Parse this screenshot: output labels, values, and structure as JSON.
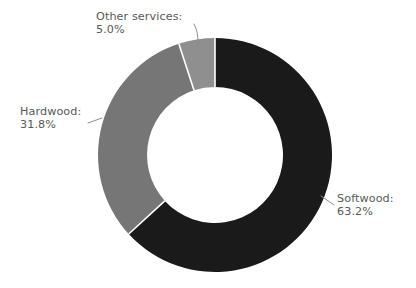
{
  "chart_data": {
    "type": "pie",
    "variant": "donut",
    "title": "",
    "subtitle": "",
    "xlabel": "",
    "ylabel": "",
    "legend_position": "none",
    "grid": false,
    "units": "percent",
    "start_angle_deg": 0,
    "direction": "clockwise",
    "hole_ratio": 0.58,
    "categories": [
      "Softwood",
      "Hardwood",
      "Other services"
    ],
    "values": [
      63.2,
      31.8,
      5.0
    ],
    "value_labels": [
      "63.2%",
      "31.8%",
      "5.0%"
    ],
    "colors": [
      "#1a1a1a",
      "#767676",
      "#8f8f8f"
    ],
    "slices": [
      {
        "name": "Softwood",
        "label_name": "Softwood:",
        "label_value": "63.2%",
        "value": 63.2,
        "color": "#1a1a1a",
        "label_position": "right"
      },
      {
        "name": "Hardwood",
        "label_name": "Hardwood:",
        "label_value": "31.8%",
        "value": 31.8,
        "color": "#767676",
        "label_position": "left"
      },
      {
        "name": "Other services",
        "label_name": "Other services:",
        "label_value": "5.0%",
        "value": 5.0,
        "color": "#8f8f8f",
        "label_position": "top-left"
      }
    ]
  },
  "style": {
    "background": "#ffffff",
    "text_color": "#595959",
    "leader_line_color": "#8c8c8c",
    "divider_color": "#ffffff"
  },
  "geometry": {
    "center_x": 215,
    "center_y": 155,
    "outer_radius": 117,
    "inner_radius": 68
  }
}
